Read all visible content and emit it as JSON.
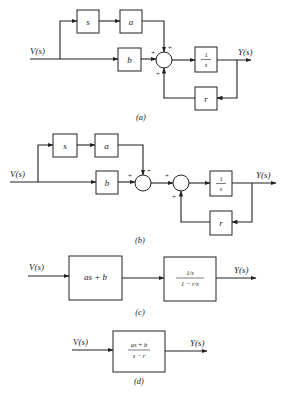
{
  "figure": {
    "diagrams": [
      {
        "id": "a",
        "caption": "(a)",
        "input_label": "V(s)",
        "output_label": "Y(s)",
        "blocks": {
          "s": "s",
          "a": "a",
          "b": "b",
          "integrator_num": "1",
          "integrator_den": "s",
          "r": "r"
        },
        "signs": {
          "b_input": "+",
          "a_input": "+",
          "feedback_input": "+"
        }
      },
      {
        "id": "b",
        "caption": "(b)",
        "input_label": "V(s)",
        "output_label": "Y(s)",
        "blocks": {
          "s": "s",
          "a": "a",
          "b": "b",
          "integrator_num": "1",
          "integrator_den": "s",
          "r": "r"
        },
        "signs": {
          "b_input": "+",
          "a_input": "+",
          "sum2_input": "+",
          "feedback_input": "+"
        }
      },
      {
        "id": "c",
        "caption": "(c)",
        "input_label": "V(s)",
        "output_label": "Y(s)",
        "blocks": {
          "first": "as + b",
          "second_num": "1/s",
          "second_den": "1 − r/s"
        }
      },
      {
        "id": "d",
        "caption": "(d)",
        "input_label": "V(s)",
        "output_label": "Y(s)",
        "blocks": {
          "tf_num": "as + b",
          "tf_den": "s − r"
        }
      }
    ]
  }
}
